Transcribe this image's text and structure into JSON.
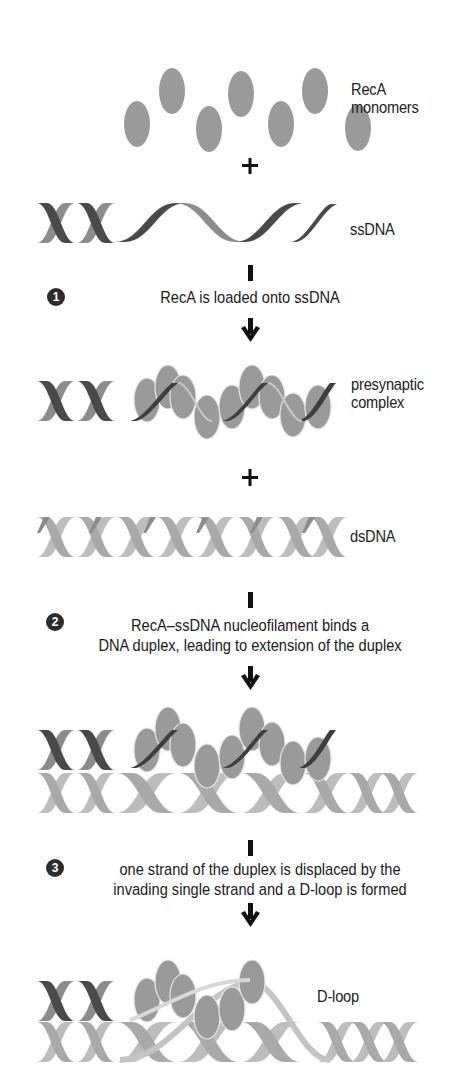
{
  "diagram": {
    "colors": {
      "monomer": "#9a9a9a",
      "strand_dark": "#4a4a4a",
      "strand_mid": "#8c8c8c",
      "strand_light": "#bdbdbd",
      "text": "#1a1a1a",
      "badge": "#2c2c2c"
    },
    "components": {
      "recA_label_line1": "RecA",
      "recA_label_line2": "monomers",
      "ssDNA_label": "ssDNA",
      "presynaptic_label_line1": "presynaptic",
      "presynaptic_label_line2": "complex",
      "dsDNA_label": "dsDNA",
      "dloop_label": "D-loop"
    },
    "operators": {
      "plus": "+"
    },
    "steps": [
      {
        "number": "1",
        "text_line1": "RecA is loaded onto ssDNA",
        "text_line2": ""
      },
      {
        "number": "2",
        "text_line1": "RecA–ssDNA nucleofilament binds a",
        "text_line2": "DNA duplex, leading to extension of the duplex"
      },
      {
        "number": "3",
        "text_line1": "one strand of the duplex is displaced by the",
        "text_line2": "invading single strand and a D-loop is formed"
      }
    ]
  }
}
